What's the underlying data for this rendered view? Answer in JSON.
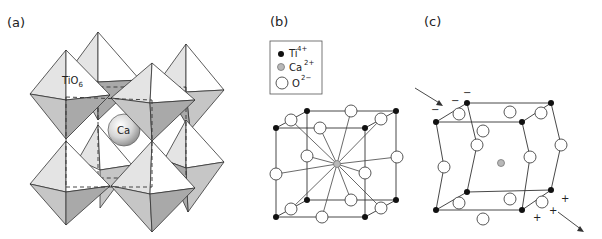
{
  "figure": {
    "panels": [
      {
        "id": "a",
        "label": "(a)",
        "title": "Perovskite CaTiO3 polyhedral model",
        "annotations": {
          "octahedron": "TiO",
          "octahedron_sub": "6",
          "cation": "Ca"
        }
      },
      {
        "id": "b",
        "label": "(b)",
        "title": "Cubic unit cell"
      },
      {
        "id": "c",
        "label": "(c)",
        "title": "Distorted cell with charge displacement"
      }
    ],
    "legend": {
      "items": [
        {
          "symbol": "filled-black-circle",
          "ion": "Ti",
          "charge": "4+",
          "color": "#111111"
        },
        {
          "symbol": "grey-circle",
          "ion": "Ca",
          "charge": "2+",
          "color": "#b8b8b8"
        },
        {
          "symbol": "open-circle",
          "ion": "O",
          "charge": "2−",
          "color": "#ffffff"
        }
      ]
    },
    "panel_c_signs": {
      "minus": "−",
      "plus": "+"
    }
  }
}
